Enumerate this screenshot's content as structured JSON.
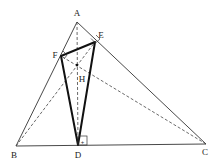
{
  "diagram": {
    "type": "geometry",
    "points": {
      "A": {
        "label": "A",
        "x": 77,
        "y": 22
      },
      "B": {
        "label": "B",
        "x": 16,
        "y": 146
      },
      "C": {
        "label": "C",
        "x": 206,
        "y": 144
      },
      "D": {
        "label": "D",
        "x": 78,
        "y": 145
      },
      "E": {
        "label": "E",
        "x": 95,
        "y": 42
      },
      "F": {
        "label": "F",
        "x": 61,
        "y": 56
      },
      "H": {
        "label": "H",
        "x": 77,
        "y": 65
      }
    },
    "labels": {
      "A": "A",
      "B": "B",
      "C": "C",
      "D": "D",
      "E": "E",
      "F": "F",
      "H": "H"
    },
    "solid_segments": [
      "AB",
      "AC",
      "BC"
    ],
    "bold_segments": [
      "DE",
      "EF",
      "FD"
    ],
    "dashed_segments": [
      "AD",
      "BE",
      "CF"
    ],
    "right_angles": [
      "D",
      "E",
      "F"
    ],
    "colors": {
      "line": "#333333",
      "bold_line": "#111111",
      "background": "#ffffff"
    }
  }
}
